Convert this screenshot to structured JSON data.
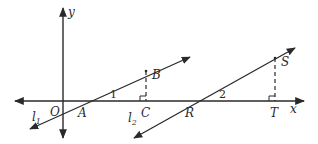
{
  "diagram": {
    "type": "coordinate-geometry",
    "colors": {
      "stroke": "#2a2a2a",
      "background": "#ffffff"
    },
    "axes": {
      "x_label": "x",
      "y_label": "y",
      "origin_label": "O"
    },
    "lines": [
      {
        "id": "l1",
        "label": "l",
        "subscript": "1",
        "through": [
          "A",
          "B"
        ]
      },
      {
        "id": "l2",
        "label": "l",
        "subscript": "2",
        "through": [
          "R",
          "S"
        ]
      }
    ],
    "points": {
      "A": "A",
      "B": "B",
      "C": "C",
      "R": "R",
      "S": "S",
      "T": "T"
    },
    "angles": [
      {
        "label": "1",
        "vertex": "A"
      },
      {
        "label": "2",
        "vertex": "R"
      }
    ],
    "perpendiculars": [
      {
        "from": "B",
        "foot": "C",
        "style": "dashed",
        "right_angle_mark": true
      },
      {
        "from": "S",
        "foot": "T",
        "style": "dashed",
        "right_angle_mark": true
      }
    ]
  }
}
